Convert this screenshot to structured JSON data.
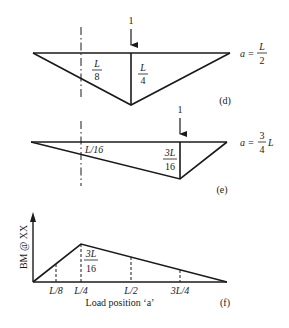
{
  "diagrams": {
    "d": {
      "tag": "(d)",
      "load": "1",
      "case_lhs": "a =",
      "case_num": "L",
      "case_den": "2",
      "section_label_num": "L",
      "section_label_den": "8",
      "peak_label_num": "L",
      "peak_label_den": "4"
    },
    "e": {
      "tag": "(e)",
      "load": "1",
      "case_lhs": "a =",
      "case_num": "3",
      "case_den": "4",
      "case_suffix": "L",
      "section_label": "L/16",
      "peak_label_num": "3L",
      "peak_label_den": "16"
    },
    "f": {
      "tag": "(f)",
      "ylabel": "BM @ XX",
      "xlabel": "Load position ‘a’",
      "ticks": [
        "L/8",
        "L/4",
        "L/2",
        "3L/4"
      ],
      "peak_label_num": "3L",
      "peak_label_den": "16"
    }
  },
  "colors": {
    "ink": "#1a1a1a",
    "background": "#ffffff"
  }
}
